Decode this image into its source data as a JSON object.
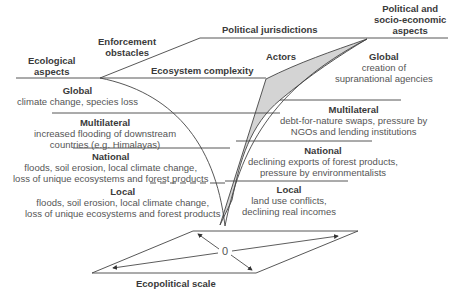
{
  "headers": {
    "ecological": [
      "Ecological",
      "aspects"
    ],
    "enforcement": [
      "Enforcement",
      "obstacles"
    ],
    "political_jurisdictions": "Political jurisdictions",
    "political_socio": [
      "Political and",
      "socio-economic",
      "aspects"
    ],
    "ecosystem_complexity": "Ecosystem complexity",
    "actors": "Actors"
  },
  "left_levels": [
    {
      "title": "Global",
      "lines": [
        "climate change, species loss"
      ]
    },
    {
      "title": "Multilateral",
      "lines": [
        "increased flooding of downstream",
        "countries (e.g. Himalayas)"
      ]
    },
    {
      "title": "National",
      "lines": [
        "floods, soil erosion, local climate change,",
        "loss of unique ecosystems and forest products"
      ]
    },
    {
      "title": "Local",
      "lines": [
        "floods, soil erosion, local climate change,",
        "loss of unique ecosystems and forest products"
      ]
    }
  ],
  "right_levels": [
    {
      "title": "Global",
      "lines": [
        "creation of",
        "supranational agencies"
      ]
    },
    {
      "title": "Multilateral",
      "lines": [
        "debt-for-nature swaps, pressure by",
        "NGOs and lending institutions"
      ]
    },
    {
      "title": "National",
      "lines": [
        "declining exports of forest products,",
        "pressure by environmentalists"
      ]
    },
    {
      "title": "Local",
      "lines": [
        "land use conflicts,",
        "declining real incomes"
      ]
    }
  ],
  "scale": {
    "origin": "0",
    "caption": "Ecopolitical scale"
  },
  "colors": {
    "line": "#444444",
    "shade": "#d4d4d4"
  }
}
